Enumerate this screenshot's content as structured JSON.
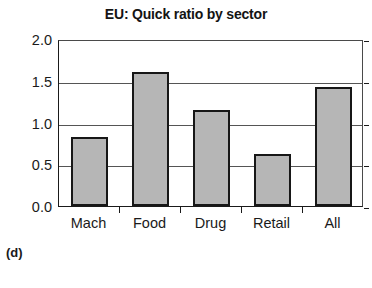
{
  "chart_data": {
    "type": "bar",
    "title": "EU: Quick ratio by sector",
    "categories": [
      "Mach",
      "Food",
      "Drug",
      "Retail",
      "All"
    ],
    "values": [
      0.83,
      1.6,
      1.15,
      0.62,
      1.42
    ],
    "xlabel": "",
    "ylabel": "",
    "ylim": [
      0.0,
      2.0
    ],
    "ytick_labels": [
      "0.0",
      "0.5",
      "1.0",
      "1.5",
      "2.0"
    ],
    "ytick_values": [
      0.0,
      0.5,
      1.0,
      1.5,
      2.0
    ],
    "grid": true,
    "legend": false,
    "bar_fill_color": "#b6b6b6",
    "bar_edge_color": "#171717",
    "axis_color": "#1a1a1a"
  },
  "panel": {
    "caption": "(d)"
  }
}
